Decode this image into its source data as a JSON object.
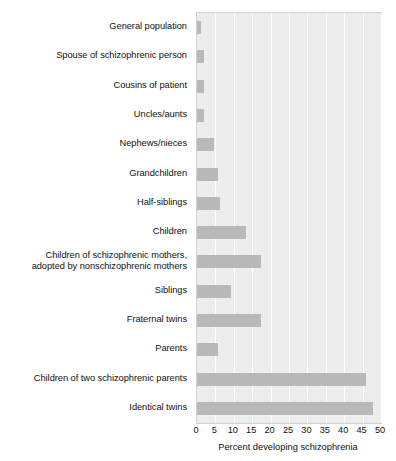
{
  "chart_data": {
    "type": "bar",
    "orientation": "horizontal",
    "title": "",
    "xlabel": "Percent developing schizophrenia",
    "ylabel": "",
    "xlim": [
      0,
      50
    ],
    "xticks": [
      0,
      5,
      10,
      15,
      20,
      25,
      30,
      35,
      40,
      45,
      50
    ],
    "xtick_labels": [
      "0",
      "5",
      "10",
      "15",
      "20",
      "25",
      "30",
      "35",
      "40",
      "45",
      "50"
    ],
    "grid": true,
    "legend": false,
    "categories": [
      "General population",
      "Spouse of  schizophrenic person",
      "Cousins of patient",
      "Uncles/aunts",
      "Nephews/nieces",
      "Grandchildren",
      "Half-siblings",
      "Children",
      "Children of schizophrenic mothers,\nadopted by nonschizophrenic mothers",
      "Siblings",
      "Fraternal twins",
      "Parents",
      "Children of two schizophrenic parents",
      "Identical twins"
    ],
    "values": [
      1,
      2,
      2,
      2,
      4.6,
      5.7,
      6.3,
      13.3,
      17.4,
      9.2,
      17.4,
      5.7,
      46,
      47.8
    ],
    "colors": {
      "bar_fill": "#b9b9b9",
      "plot_background": "#ededed",
      "gridline": "#ffffff",
      "plot_border": "#d2d2d2",
      "text": "#111111"
    }
  }
}
